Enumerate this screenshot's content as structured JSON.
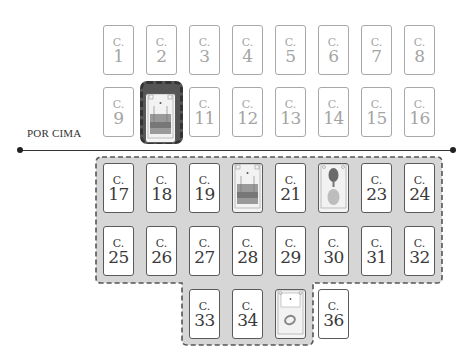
{
  "diagram": {
    "type": "card-spread-layout",
    "divider_label": "POR CIMA",
    "card_prefix": "C.",
    "colors": {
      "outline_card_border": "#a8a8a8",
      "outline_card_text": "#a4a4a4",
      "solid_card_border": "#5a5a5a",
      "solid_card_text": "#3a3a3a",
      "region_fill": "#d6d6d6",
      "region_border": "#555555",
      "highlight_fill": "#555555",
      "line_color": "#333333"
    },
    "above_line": {
      "rows": [
        {
          "cards": [
            {
              "num": "1",
              "kind": "label"
            },
            {
              "num": "2",
              "kind": "label"
            },
            {
              "num": "3",
              "kind": "label"
            },
            {
              "num": "4",
              "kind": "label"
            },
            {
              "num": "5",
              "kind": "label"
            },
            {
              "num": "6",
              "kind": "label"
            },
            {
              "num": "7",
              "kind": "label"
            },
            {
              "num": "8",
              "kind": "label"
            }
          ]
        },
        {
          "cards": [
            {
              "num": "9",
              "kind": "label"
            },
            {
              "num": "10",
              "kind": "picture",
              "picture": "garden-scene",
              "highlighted": true
            },
            {
              "num": "11",
              "kind": "label"
            },
            {
              "num": "12",
              "kind": "label"
            },
            {
              "num": "13",
              "kind": "label"
            },
            {
              "num": "14",
              "kind": "label"
            },
            {
              "num": "15",
              "kind": "label"
            },
            {
              "num": "16",
              "kind": "label"
            }
          ]
        }
      ]
    },
    "below_line": {
      "rows": [
        {
          "cards": [
            {
              "num": "17",
              "kind": "label"
            },
            {
              "num": "18",
              "kind": "label"
            },
            {
              "num": "19",
              "kind": "label"
            },
            {
              "num": "20",
              "kind": "picture",
              "picture": "garden-scene"
            },
            {
              "num": "21",
              "kind": "label"
            },
            {
              "num": "22",
              "kind": "picture",
              "picture": "tree-and-figure"
            },
            {
              "num": "23",
              "kind": "label"
            },
            {
              "num": "24",
              "kind": "label"
            }
          ]
        },
        {
          "cards": [
            {
              "num": "25",
              "kind": "label"
            },
            {
              "num": "26",
              "kind": "label"
            },
            {
              "num": "27",
              "kind": "label"
            },
            {
              "num": "28",
              "kind": "label"
            },
            {
              "num": "29",
              "kind": "label"
            },
            {
              "num": "30",
              "kind": "label"
            },
            {
              "num": "31",
              "kind": "label"
            },
            {
              "num": "32",
              "kind": "label"
            }
          ]
        },
        {
          "cards": [
            {
              "num": "33",
              "kind": "label"
            },
            {
              "num": "34",
              "kind": "label"
            },
            {
              "num": "35",
              "kind": "picture",
              "picture": "ring-card"
            },
            {
              "num": "36",
              "kind": "label"
            }
          ]
        }
      ]
    }
  }
}
